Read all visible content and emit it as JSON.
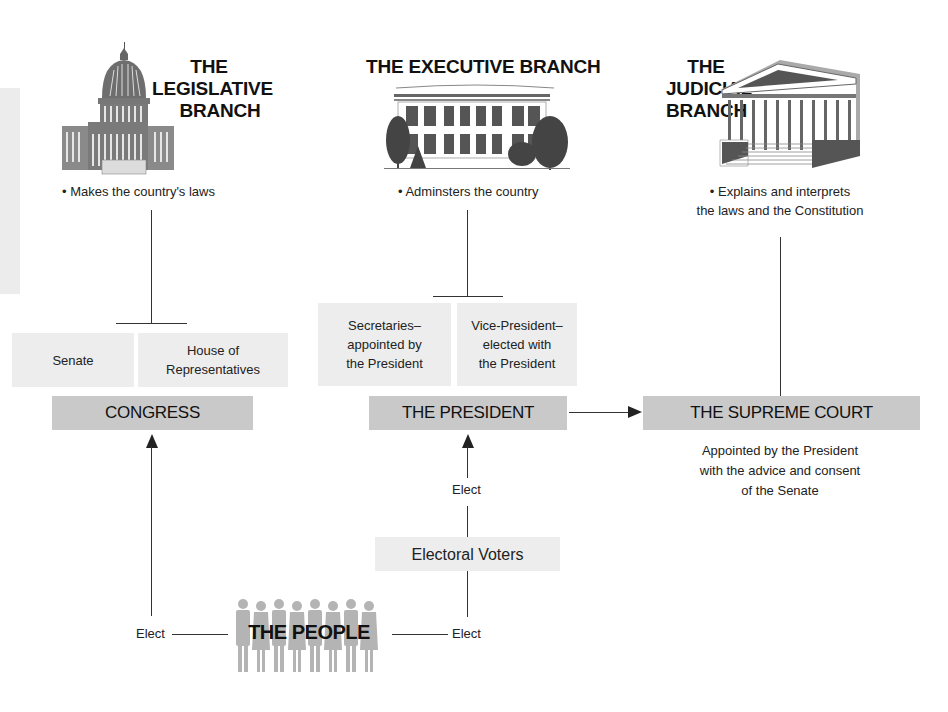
{
  "branches": {
    "legislative": {
      "title_lines": [
        "THE",
        "LEGISLATIVE",
        "BRANCH"
      ],
      "description": "• Makes the country's laws",
      "icon": "capitol-building-icon"
    },
    "executive": {
      "title": "THE EXECUTIVE BRANCH",
      "description": "• Adminsters the country",
      "icon": "white-house-icon"
    },
    "judicial": {
      "title_lines": [
        "THE",
        "JUDICIAL",
        "BRANCH"
      ],
      "description_lines": [
        "• Explains and interprets",
        "the laws and the Constitution"
      ],
      "icon": "supreme-court-building-icon"
    }
  },
  "congress": {
    "label": "CONGRESS",
    "chambers": [
      {
        "lines": [
          "Senate"
        ]
      },
      {
        "lines": [
          "House of",
          "Representatives"
        ]
      }
    ]
  },
  "president": {
    "label": "THE PRESIDENT",
    "subordinates": [
      {
        "lines": [
          "Secretaries–",
          "appointed by",
          "the President"
        ]
      },
      {
        "lines": [
          "Vice-President–",
          "elected with",
          "the President"
        ]
      }
    ]
  },
  "supreme_court": {
    "label": "THE SUPREME COURT",
    "note_lines": [
      "Appointed by the President",
      "with the advice and consent",
      "of the Senate"
    ]
  },
  "electoral_voters": {
    "label": "Electoral Voters"
  },
  "people": {
    "label": "THE PEOPLE",
    "icon": "crowd-silhouettes-icon",
    "figure_count": 8
  },
  "edge_labels": {
    "elect_left": "Elect",
    "elect_right": "Elect",
    "elect_upper": "Elect"
  },
  "colors": {
    "dark_box": "#c9c9c9",
    "light_box": "#ededed",
    "line": "#333333",
    "people": "#b4b4b4"
  }
}
